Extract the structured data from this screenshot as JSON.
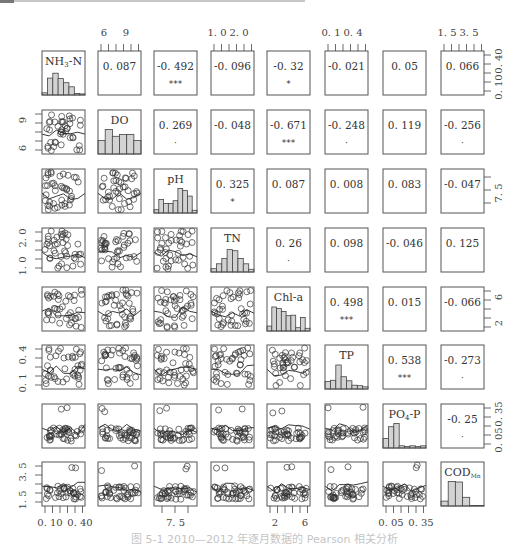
{
  "chart_data": {
    "type": "pairs-correlation-matrix",
    "title": "",
    "caption": "图 5-1  2010—2012 年逐月数据的 Pearson 相关分析",
    "variables": [
      "NH3-N",
      "DO",
      "pH",
      "TN",
      "Chl-a",
      "TP",
      "PO4-P",
      "CODMn"
    ],
    "diagonal_labels": [
      {
        "main": "NH",
        "sub": "3",
        "rest": "-N"
      },
      {
        "main": "DO",
        "sub": "",
        "rest": ""
      },
      {
        "main": "pH",
        "sub": "",
        "rest": ""
      },
      {
        "main": "TN",
        "sub": "",
        "rest": ""
      },
      {
        "main": "Chl-a",
        "sub": "",
        "rest": ""
      },
      {
        "main": "TP",
        "sub": "",
        "rest": ""
      },
      {
        "main": "PO",
        "sub": "4",
        "rest": "-P"
      },
      {
        "main": "COD",
        "sub": "Mn",
        "rest": ""
      }
    ],
    "correlations": [
      {
        "row": 0,
        "col": 1,
        "r": "0.087",
        "sig": ""
      },
      {
        "row": 0,
        "col": 2,
        "r": "-0.492",
        "sig": "***"
      },
      {
        "row": 0,
        "col": 3,
        "r": "-0.096",
        "sig": ""
      },
      {
        "row": 0,
        "col": 4,
        "r": "-0.32",
        "sig": "*"
      },
      {
        "row": 0,
        "col": 5,
        "r": "-0.021",
        "sig": ""
      },
      {
        "row": 0,
        "col": 6,
        "r": "0.05",
        "sig": ""
      },
      {
        "row": 0,
        "col": 7,
        "r": "0.066",
        "sig": ""
      },
      {
        "row": 1,
        "col": 2,
        "r": "0.269",
        "sig": "."
      },
      {
        "row": 1,
        "col": 3,
        "r": "-0.048",
        "sig": ""
      },
      {
        "row": 1,
        "col": 4,
        "r": "-0.671",
        "sig": "***"
      },
      {
        "row": 1,
        "col": 5,
        "r": "-0.248",
        "sig": "."
      },
      {
        "row": 1,
        "col": 6,
        "r": "0.119",
        "sig": ""
      },
      {
        "row": 1,
        "col": 7,
        "r": "-0.256",
        "sig": "."
      },
      {
        "row": 2,
        "col": 3,
        "r": "0.325",
        "sig": "*"
      },
      {
        "row": 2,
        "col": 4,
        "r": "0.087",
        "sig": ""
      },
      {
        "row": 2,
        "col": 5,
        "r": "0.008",
        "sig": ""
      },
      {
        "row": 2,
        "col": 6,
        "r": "0.083",
        "sig": ""
      },
      {
        "row": 2,
        "col": 7,
        "r": "-0.047",
        "sig": ""
      },
      {
        "row": 3,
        "col": 4,
        "r": "0.26",
        "sig": "."
      },
      {
        "row": 3,
        "col": 5,
        "r": "0.098",
        "sig": ""
      },
      {
        "row": 3,
        "col": 6,
        "r": "-0.046",
        "sig": ""
      },
      {
        "row": 3,
        "col": 7,
        "r": "0.125",
        "sig": ""
      },
      {
        "row": 4,
        "col": 5,
        "r": "0.498",
        "sig": "***"
      },
      {
        "row": 4,
        "col": 6,
        "r": "0.015",
        "sig": ""
      },
      {
        "row": 4,
        "col": 7,
        "r": "-0.066",
        "sig": ""
      },
      {
        "row": 5,
        "col": 6,
        "r": "0.538",
        "sig": "***"
      },
      {
        "row": 5,
        "col": 7,
        "r": "-0.273",
        "sig": "."
      },
      {
        "row": 6,
        "col": 7,
        "r": "-0.25",
        "sig": "."
      }
    ],
    "histograms": [
      [
        0.08,
        0.62,
        0.8,
        0.6,
        0.45,
        0.3,
        0.0,
        0.04
      ],
      [
        0.5,
        0.9,
        0.65,
        0.72,
        0.72,
        0.5
      ],
      [
        0.12,
        0.5,
        0.35,
        0.35,
        0.45,
        0.9,
        0.82,
        0.62,
        0.1
      ],
      [
        0.12,
        0.3,
        0.5,
        0.82,
        0.78,
        0.5,
        0.3,
        0.1
      ],
      [
        0.18,
        0.88,
        0.82,
        0.72,
        0.56,
        0.58,
        0.12,
        0.5,
        0.1
      ],
      [
        0.28,
        0.32,
        0.88,
        0.45,
        0.3,
        0.14,
        0.12,
        0.08
      ],
      [
        0.35,
        0.78,
        0.9,
        0.08,
        0.0,
        0.08,
        0.0,
        0.08
      ],
      [
        0.18,
        0.9,
        0.88,
        0.32,
        0.02,
        0.02
      ]
    ],
    "axes": {
      "top": [
        {
          "col": 1,
          "ticks": [
            "6",
            "9"
          ]
        },
        {
          "col": 3,
          "ticks": [
            "1.0",
            "2.0"
          ]
        },
        {
          "col": 5,
          "ticks": [
            "0.1",
            "0.4"
          ]
        },
        {
          "col": 7,
          "ticks": [
            "1.5",
            "3.5"
          ]
        }
      ],
      "bottom": [
        {
          "col": 0,
          "ticks": [
            "0.10",
            "0.40"
          ]
        },
        {
          "col": 2,
          "ticks": [
            "7.5"
          ]
        },
        {
          "col": 4,
          "ticks": [
            "2",
            "6"
          ]
        },
        {
          "col": 6,
          "ticks": [
            "0.05",
            "0.35"
          ]
        }
      ],
      "left": [
        {
          "row": 1,
          "ticks": [
            "6",
            "9"
          ]
        },
        {
          "row": 3,
          "ticks": [
            "1.0",
            "2.0"
          ]
        },
        {
          "row": 5,
          "ticks": [
            "0.1",
            "0.4"
          ]
        },
        {
          "row": 7,
          "ticks": [
            "1.5",
            "3.5"
          ]
        }
      ],
      "right": [
        {
          "row": 0,
          "ticks": [
            "0.10",
            "0.40"
          ]
        },
        {
          "row": 2,
          "ticks": [
            "7.5"
          ]
        },
        {
          "row": 4,
          "ticks": [
            "2",
            "6"
          ]
        },
        {
          "row": 6,
          "ticks": [
            "0.05",
            "0.35"
          ]
        }
      ]
    },
    "significance_codes": {
      "***": "p<0.001",
      "*": "p<0.05",
      ".": "p<0.1"
    },
    "grid": false,
    "legend": "none"
  },
  "colors": {
    "frame": "#555555",
    "hist_fill": "#d3d3d3",
    "text": "#333333",
    "points": "#333333"
  }
}
